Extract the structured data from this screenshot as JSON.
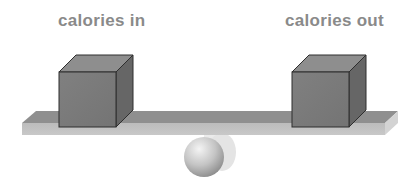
{
  "diagram": {
    "labels": {
      "left": "calories in",
      "right": "calories out"
    },
    "elements": {
      "left_block": "calories in cube",
      "right_block": "calories out cube",
      "beam": "balance beam",
      "fulcrum": "sphere pivot"
    },
    "colors": {
      "label_text": "#8a8a8a",
      "cube_front": "#7a7a7a",
      "cube_top": "#8e8e8e",
      "cube_side": "#666666",
      "cube_edge": "#2e2e2e",
      "beam_top": "#8f8f8f",
      "beam_front": "#bdbdbd",
      "beam_end": "#d2d2d2",
      "sphere_light": "#f2f2f2",
      "sphere_dark": "#8c8c8c"
    }
  }
}
